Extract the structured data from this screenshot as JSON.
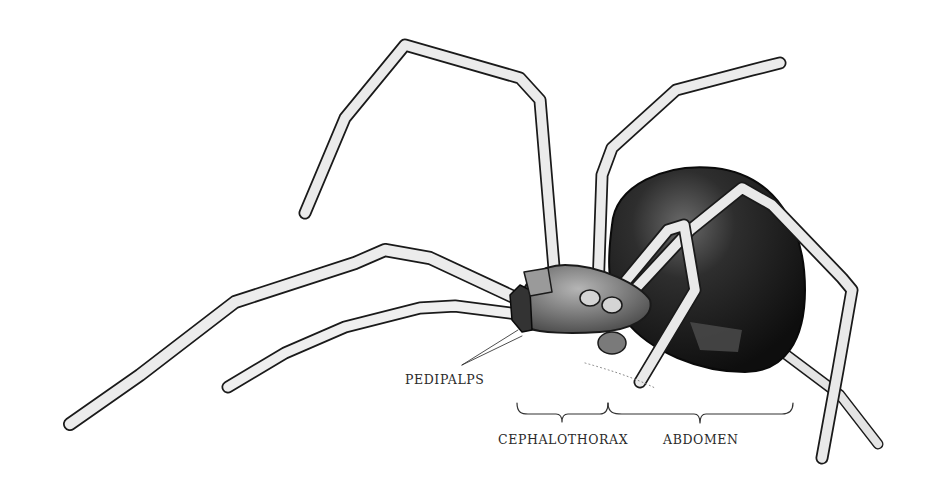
{
  "figure": {
    "colors": {
      "background": "#ffffff",
      "ink": "#1a1a1a",
      "leg_fill": "#ececec",
      "abdomen": "#151515",
      "cephalothorax": "#8a8a8a",
      "hourglass": "#4a4a4a"
    }
  },
  "labels": {
    "pedipalps": "PEDIPALPS",
    "cephalothorax": "CEPHALOTHORAX",
    "abdomen": "ABDOMEN"
  }
}
